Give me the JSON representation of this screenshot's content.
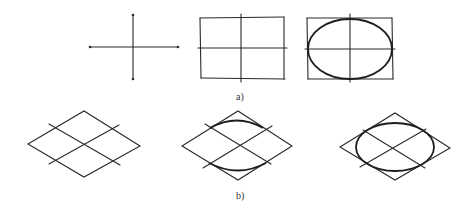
{
  "figure": {
    "row_a": {
      "label": "a)",
      "panels": [
        {
          "name": "axes-cross",
          "description": "two perpendicular center lines"
        },
        {
          "name": "bounding-rectangle",
          "description": "rectangle with center lines"
        },
        {
          "name": "ellipse-in-rectangle",
          "description": "ellipse inscribed in rectangle with center lines"
        }
      ]
    },
    "row_b": {
      "label": "b)",
      "panels": [
        {
          "name": "isometric-rhombus",
          "description": "rhombus divided by isometric axes"
        },
        {
          "name": "rhombus-with-arcs",
          "description": "rhombus with major arcs sketched"
        },
        {
          "name": "ellipse-in-rhombus",
          "description": "isometric ellipse inscribed in rhombus"
        }
      ]
    },
    "colors": {
      "line": "#2a2a2a",
      "background": "#ffffff"
    }
  }
}
